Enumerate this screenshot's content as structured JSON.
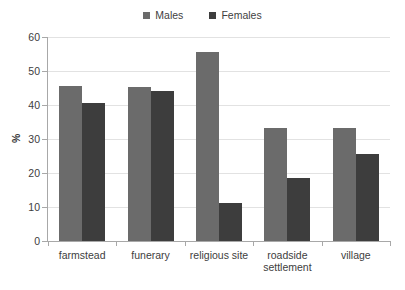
{
  "chart_data": {
    "type": "bar",
    "title": "",
    "xlabel": "",
    "ylabel": "%",
    "ylim": [
      0,
      60
    ],
    "ytick_step": 10,
    "yticks": [
      60,
      50,
      40,
      30,
      20,
      10,
      0
    ],
    "grid": true,
    "legend_position": "top-center",
    "categories": [
      "farmstead",
      "funerary",
      "religious site",
      "roadside settlement",
      "village"
    ],
    "series": [
      {
        "name": "Males",
        "color": "#6b6b6b",
        "values": [
          45.5,
          45.2,
          55.5,
          33.3,
          33.3
        ]
      },
      {
        "name": "Females",
        "color": "#3d3d3d",
        "values": [
          40.7,
          44.0,
          11.1,
          18.5,
          25.5
        ]
      }
    ]
  },
  "legend": {
    "entries": [
      {
        "label": "Males",
        "color": "#6b6b6b"
      },
      {
        "label": "Females",
        "color": "#3d3d3d"
      }
    ]
  },
  "axes": {
    "y_title": "%",
    "y_tick_labels": [
      "60",
      "50",
      "40",
      "30",
      "20",
      "10",
      "0"
    ],
    "x_tick_labels": [
      "farmstead",
      "funerary",
      "religious site",
      "roadside settlement",
      "village"
    ]
  }
}
